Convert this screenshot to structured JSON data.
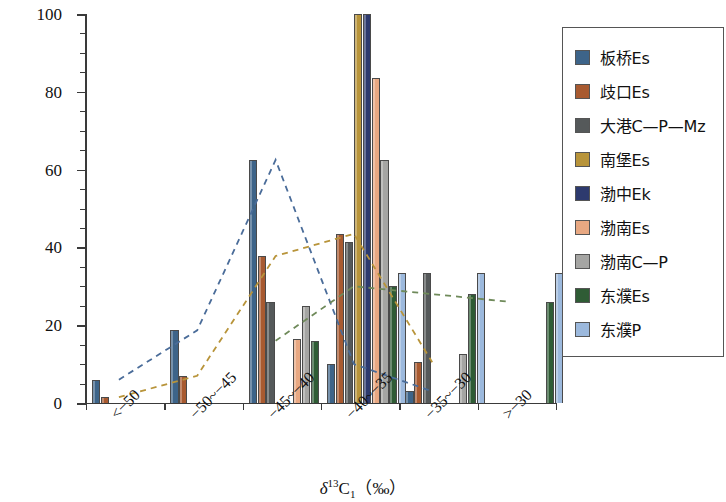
{
  "chart_data": {
    "type": "bar",
    "title": "",
    "xlabel": "δ¹³C₁ （‰）",
    "ylabel": "样品数占比（%）",
    "ylim": [
      0,
      100
    ],
    "ytick_labels": [
      "0",
      "20",
      "40",
      "60",
      "80",
      "100"
    ],
    "ytick_values": [
      0,
      20,
      40,
      60,
      80,
      100
    ],
    "ytick_minor_step": 5,
    "grid": false,
    "legend_position": "right",
    "categories": [
      "<−50",
      "−50~−45",
      "−45~−40",
      "−40~−35",
      "−35~−30",
      ">−30"
    ],
    "series": [
      {
        "name": "板桥Es",
        "color": "#3d6489",
        "values": [
          6.0,
          18.7,
          62.5,
          10.0,
          3.0,
          null
        ]
      },
      {
        "name": "歧口Es",
        "color": "#a85a30",
        "values": [
          1.5,
          7.0,
          37.8,
          43.5,
          10.5,
          null
        ]
      },
      {
        "name": "大港C—P—Mz",
        "color": "#55595a",
        "values": [
          null,
          null,
          26.0,
          41.5,
          33.5,
          null
        ]
      },
      {
        "name": "南堡Es",
        "color": "#b8943a",
        "values": [
          null,
          null,
          null,
          100.0,
          null,
          null
        ]
      },
      {
        "name": "渤中Ek",
        "color": "#2d3a6e",
        "values": [
          null,
          null,
          null,
          100.0,
          null,
          null
        ]
      },
      {
        "name": "渤南Es",
        "color": "#e8a882",
        "values": [
          null,
          null,
          16.5,
          83.5,
          null,
          null
        ]
      },
      {
        "name": "渤南C—P",
        "color": "#a5a5a3",
        "values": [
          null,
          null,
          25.0,
          62.5,
          12.5,
          null
        ]
      },
      {
        "name": "东濮Es",
        "color": "#2f5c35",
        "values": [
          null,
          null,
          16.0,
          30.0,
          28.0,
          26.0
        ]
      },
      {
        "name": "东濮P",
        "color": "#9cb9dd",
        "values": [
          null,
          null,
          null,
          33.5,
          33.5,
          33.5
        ]
      }
    ],
    "trend_lines": [
      {
        "name": "板桥Es trend",
        "color": "#4a6c99",
        "style": "dashed",
        "points": [
          [
            0,
            6.0
          ],
          [
            1,
            18.7
          ],
          [
            2,
            62.5
          ],
          [
            3,
            10.0
          ],
          [
            4,
            3.0
          ]
        ]
      },
      {
        "name": "歧口Es trend",
        "color": "#b8943a",
        "style": "dashed",
        "points": [
          [
            0,
            1.5
          ],
          [
            1,
            7.0
          ],
          [
            2,
            37.8
          ],
          [
            3,
            43.5
          ],
          [
            4,
            10.5
          ]
        ]
      },
      {
        "name": "东濮Es trend",
        "color": "#6f8a5a",
        "style": "dashed",
        "points": [
          [
            2,
            16.0
          ],
          [
            3,
            30.0
          ],
          [
            4,
            28.0
          ],
          [
            5,
            26.0
          ]
        ]
      }
    ]
  },
  "legend": {
    "items": [
      {
        "label": "板桥Es",
        "color": "#3d6489"
      },
      {
        "label": "歧口Es",
        "color": "#a85a30"
      },
      {
        "label": "大港C—P—Mz",
        "color": "#55595a"
      },
      {
        "label": "南堡Es",
        "color": "#b8943a"
      },
      {
        "label": "渤中Ek",
        "color": "#2d3a6e"
      },
      {
        "label": "渤南Es",
        "color": "#e8a882"
      },
      {
        "label": "渤南C—P",
        "color": "#a5a5a3"
      },
      {
        "label": "东濮Es",
        "color": "#2f5c35"
      },
      {
        "label": "东濮P",
        "color": "#9cb9dd"
      }
    ]
  },
  "axis": {
    "x_title_delta": "δ",
    "x_title_sup": "13",
    "x_title_c": "C",
    "x_title_sub": "1",
    "x_title_unit": "（‰）"
  }
}
